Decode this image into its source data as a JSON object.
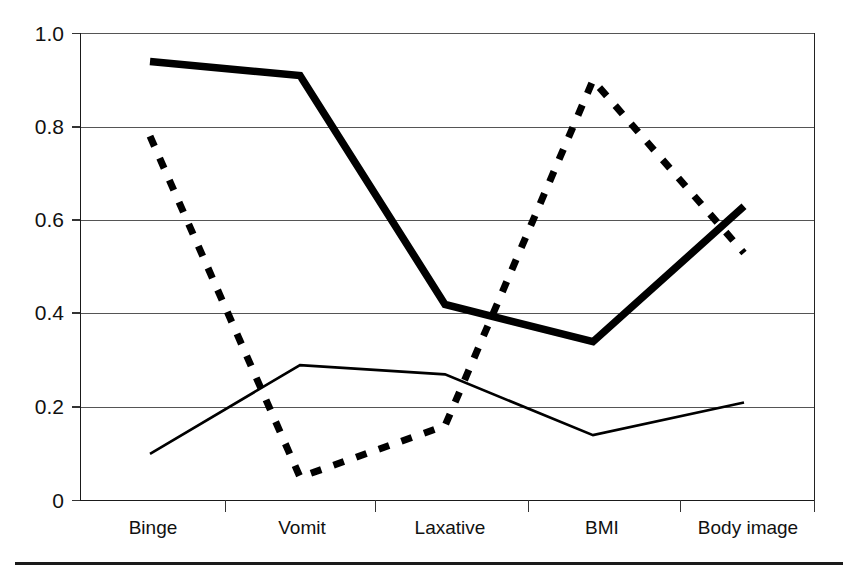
{
  "chart_data": {
    "type": "line",
    "title": "",
    "subtitle": "",
    "xlabel": "",
    "ylabel": "",
    "categories": [
      "Binge",
      "Vomit",
      "Laxative",
      "BMI",
      "Body image"
    ],
    "ylim": [
      0,
      1.0
    ],
    "yticks": [
      0,
      0.2,
      0.4,
      0.6,
      0.8,
      1.0
    ],
    "ytick_labels": [
      "0",
      "0.2",
      "0.4",
      "0.6",
      "0.8",
      "1.0"
    ],
    "grid": true,
    "grid_axis": "y",
    "legend": "none",
    "series": [
      {
        "name": "thick-solid",
        "style": "solid-thick",
        "color": "#000000",
        "values": [
          0.94,
          0.91,
          0.42,
          0.34,
          0.63
        ]
      },
      {
        "name": "dashed",
        "style": "dashed-thick",
        "color": "#000000",
        "values": [
          0.78,
          0.05,
          0.16,
          0.9,
          0.53
        ]
      },
      {
        "name": "thin-solid",
        "style": "solid-thin",
        "color": "#000000",
        "values": [
          0.1,
          0.29,
          0.27,
          0.14,
          0.21
        ]
      }
    ]
  },
  "axis": {
    "y_labels": {
      "t0": "0",
      "t1": "0.2",
      "t2": "0.4",
      "t3": "0.6",
      "t4": "0.8",
      "t5": "1.0"
    },
    "x_labels": {
      "c0": "Binge",
      "c1": "Vomit",
      "c2": "Laxative",
      "c3": "BMI",
      "c4": "Body image"
    }
  }
}
